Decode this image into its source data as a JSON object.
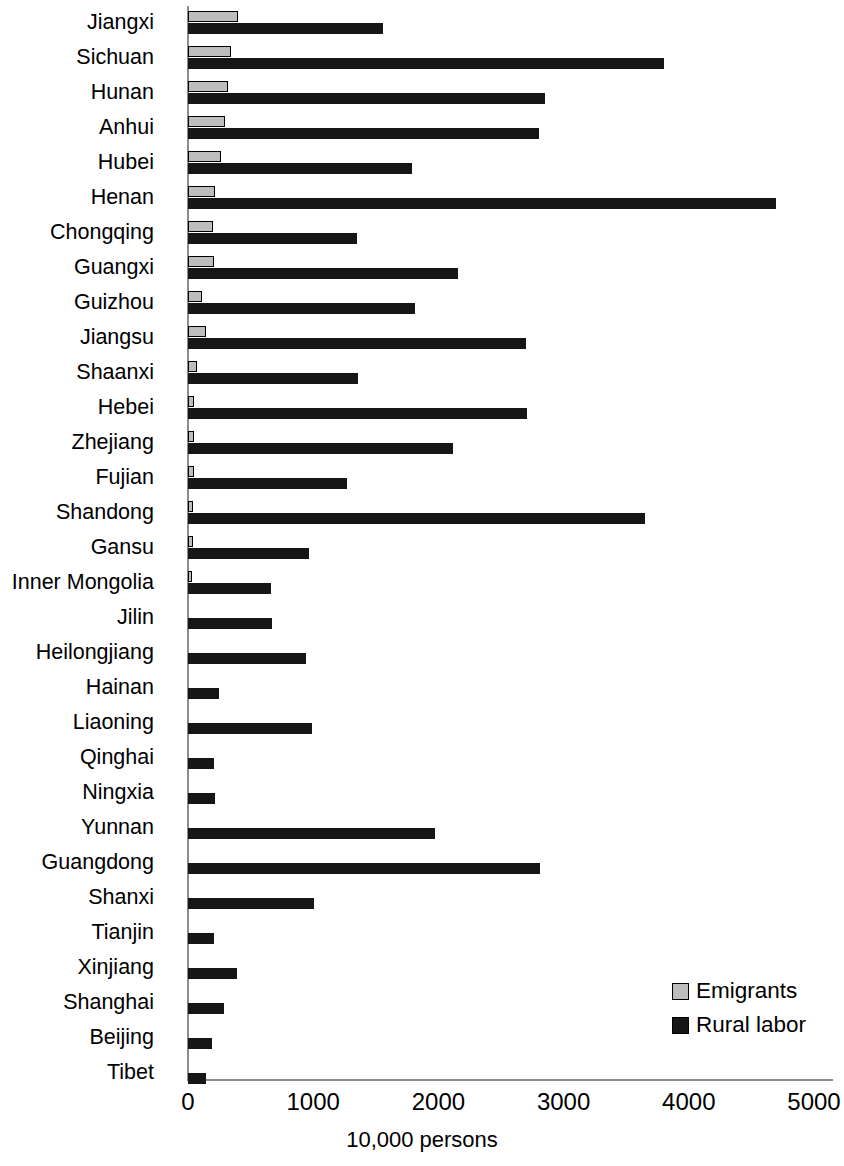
{
  "chart_data": {
    "type": "bar",
    "orientation": "horizontal",
    "title": "",
    "xlabel": "10,000 persons",
    "ylabel": "",
    "xlim": [
      0,
      5000
    ],
    "xticks": [
      0,
      1000,
      2000,
      3000,
      4000,
      5000
    ],
    "xtick_labels": [
      "0",
      "1000",
      "2000",
      "3000",
      "4000",
      "5000"
    ],
    "grid": false,
    "legend_position": "bottom-right",
    "categories": [
      "Jiangxi",
      "Sichuan",
      "Hunan",
      "Anhui",
      "Hubei",
      "Henan",
      "Chongqing",
      "Guangxi",
      "Guizhou",
      "Jiangsu",
      "Shaanxi",
      "Hebei",
      "Zhejiang",
      "Fujian",
      "Shandong",
      "Gansu",
      "Inner Mongolia",
      "Jilin",
      "Heilongjiang",
      "Hainan",
      "Liaoning",
      "Qinghai",
      "Ningxia",
      "Yunnan",
      "Guangdong",
      "Shanxi",
      "Tianjin",
      "Xinjiang",
      "Shanghai",
      "Beijing",
      "Tibet"
    ],
    "series": [
      {
        "name": "Emigrants",
        "color": "#bdbdbd",
        "values": [
          400,
          345,
          320,
          295,
          260,
          215,
          200,
          205,
          115,
          140,
          75,
          50,
          50,
          45,
          42,
          38,
          30,
          0,
          0,
          0,
          0,
          0,
          0,
          0,
          0,
          0,
          0,
          0,
          0,
          0,
          0
        ]
      },
      {
        "name": "Rural labor",
        "color": "#161616",
        "values": [
          1560,
          3800,
          2850,
          2800,
          1790,
          4700,
          1350,
          2160,
          1810,
          2700,
          1360,
          2710,
          2120,
          1270,
          3650,
          970,
          660,
          670,
          940,
          250,
          990,
          210,
          215,
          1970,
          2810,
          1010,
          210,
          390,
          285,
          190,
          140
        ]
      }
    ]
  },
  "legend": {
    "items": [
      {
        "label": "Emigrants",
        "swatch": "emigrants-swatch"
      },
      {
        "label": "Rural labor",
        "swatch": "rural-labor-swatch"
      }
    ]
  }
}
